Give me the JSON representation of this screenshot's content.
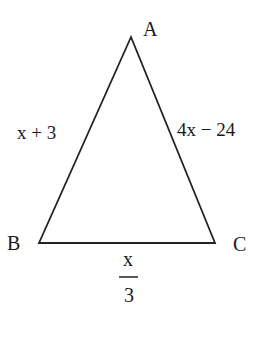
{
  "diagram": {
    "type": "triangle",
    "stroke_color": "#222222",
    "vertices": [
      {
        "name": "A",
        "x": 131,
        "y": 37
      },
      {
        "name": "B",
        "x": 39,
        "y": 243
      },
      {
        "name": "C",
        "x": 215,
        "y": 243
      }
    ],
    "vertex_labels": {
      "A": "A",
      "B": "B",
      "C": "C"
    },
    "side_labels": {
      "AB": "x + 3",
      "AC": "4x − 24",
      "BC_numerator": "x",
      "BC_denominator": "3"
    }
  }
}
